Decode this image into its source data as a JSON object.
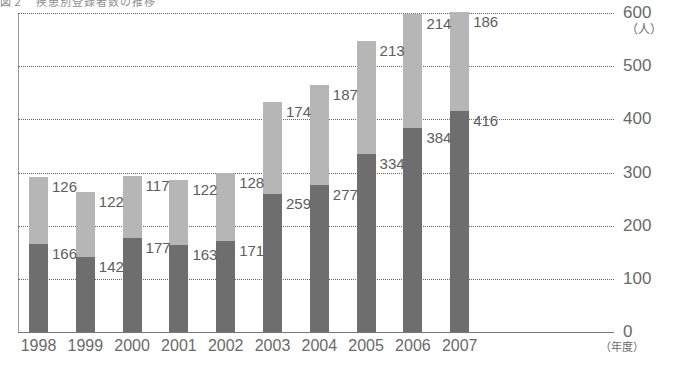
{
  "caption": {
    "top": "図２　疾患別登録者数の推移",
    "bottom": "　　　　　　　　　　　　　　　　　　　　　　　　"
  },
  "axes": {
    "y_unit": "（人）",
    "x_unit": "（年度）",
    "y_ticks": [
      "600",
      "500",
      "400",
      "300",
      "200",
      "100",
      "0"
    ],
    "y_tick_values": [
      600,
      500,
      400,
      300,
      200,
      100,
      0
    ],
    "y_min": 0,
    "y_max": 600
  },
  "colors": {
    "series_bottom": "#6e6e6e",
    "series_top": "#b6b6b6",
    "gridline": "#666666",
    "axis": "#777777",
    "text": "#5d5d5d"
  },
  "chart_data": {
    "type": "bar",
    "title": "図２　疾患別登録者数の推移",
    "xlabel": "（年度）",
    "ylabel": "（人）",
    "ylim": [
      0,
      600
    ],
    "grid": true,
    "stacked": true,
    "legend": null,
    "categories": [
      "1998",
      "1999",
      "2000",
      "2001",
      "2002",
      "2003",
      "2004",
      "2005",
      "2006",
      "2007"
    ],
    "series": [
      {
        "name": "lower",
        "color": "#6e6e6e",
        "values": [
          166,
          142,
          177,
          163,
          171,
          259,
          277,
          334,
          384,
          416
        ]
      },
      {
        "name": "upper",
        "color": "#b6b6b6",
        "values": [
          126,
          122,
          117,
          122,
          128,
          174,
          187,
          213,
          214,
          186
        ]
      }
    ],
    "totals": [
      292,
      264,
      294,
      285,
      299,
      433,
      464,
      547,
      598,
      602
    ]
  }
}
